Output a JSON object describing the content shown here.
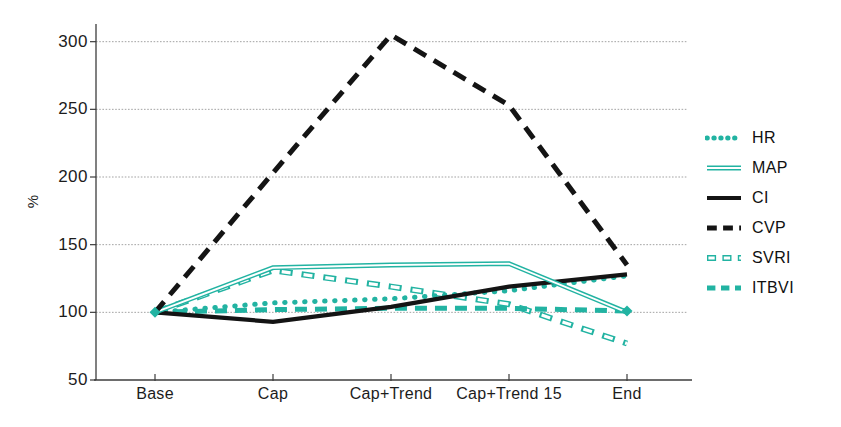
{
  "figure": {
    "background": "#ffffff"
  },
  "colors": {
    "teal": "#22b3a2",
    "black": "#141414",
    "grid": "#a3a3a3",
    "axis": "#3c3c3c",
    "text": "#1c1c1c",
    "bg": "#ffffff"
  },
  "chart_data": {
    "type": "line",
    "title": "",
    "ylabel": "%",
    "xlabel": "",
    "categories": [
      "Base",
      "Cap",
      "Cap+Trend",
      "Cap+Trend 15",
      "End"
    ],
    "yticks": [
      50,
      100,
      150,
      200,
      250,
      300
    ],
    "ylim": [
      50,
      310
    ],
    "grid": true,
    "legend_position": "right",
    "series": [
      {
        "name": "HR",
        "style": "dotted",
        "color": "teal",
        "values": [
          100,
          107,
          110,
          116,
          127
        ]
      },
      {
        "name": "MAP",
        "style": "double",
        "color": "teal",
        "values": [
          100,
          133,
          135,
          136,
          100
        ]
      },
      {
        "name": "CI",
        "style": "solid",
        "color": "black",
        "values": [
          100,
          93,
          104,
          119,
          128
        ]
      },
      {
        "name": "CVP",
        "style": "dashed",
        "color": "black",
        "values": [
          100,
          203,
          305,
          253,
          135
        ]
      },
      {
        "name": "SVRI",
        "style": "hollow-dash",
        "color": "teal",
        "values": [
          100,
          131,
          119,
          106,
          77
        ]
      },
      {
        "name": "ITBVI",
        "style": "dash",
        "color": "teal",
        "values": [
          100,
          102,
          103,
          103,
          101
        ]
      }
    ],
    "endpoint_markers": [
      {
        "category_index": 0,
        "value": 100,
        "color": "teal"
      },
      {
        "category_index": 4,
        "value": 101,
        "color": "teal"
      }
    ]
  }
}
